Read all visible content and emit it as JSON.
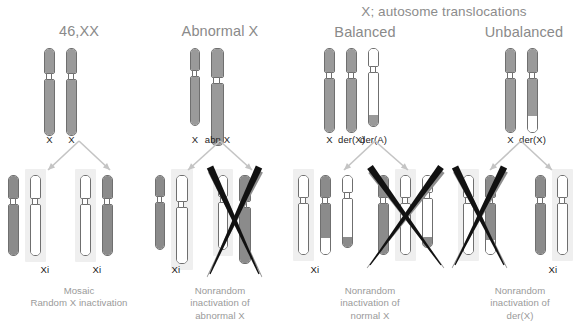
{
  "figure": {
    "title_group": {
      "label": "X; autosome translocations",
      "x": 320,
      "y": 4,
      "width": 248
    },
    "colors": {
      "chromosome_gray": "#9a9a9a",
      "chromosome_dark": "#6b6b6b",
      "chromosome_white": "#ffffff",
      "outline": "#6f6f6f",
      "highlight_box": "#efefef",
      "arrow": "#c4c4c4",
      "cross_mark": "#111111",
      "cross_shadow": "#8d8d8d",
      "title_text": "#8a8a8a",
      "caption_text": "#9a9a9a",
      "label_text": "#1d1d1d"
    },
    "columns": [
      {
        "id": "normal-female",
        "title": "46,XX",
        "title_x": 19,
        "title_y": 23,
        "title_w": 120,
        "parent": {
          "x": 44,
          "y": 48,
          "chromosomes": [
            {
              "name": "X",
              "w": 11,
              "top_h": 26,
              "bot_h": 57,
              "segments": [
                {
                  "from": 0,
                  "to": 1,
                  "fill": "#9a9a9a"
                }
              ]
            },
            {
              "name": "X",
              "w": 11,
              "top_h": 26,
              "bot_h": 57,
              "segments": [
                {
                  "from": 0,
                  "to": 1,
                  "fill": "#9a9a9a"
                }
              ]
            }
          ],
          "labels": [
            "X",
            "X"
          ],
          "label_y": 134
        },
        "arrow": {
          "apex_x": 79,
          "apex_y": 141,
          "left_x": 48,
          "right_x": 110,
          "tip_y": 170
        },
        "cells": [
          {
            "x": 8,
            "y": 175,
            "crossed": false,
            "xi_label": "Xi",
            "xi_label_x": 30,
            "chromosomes": [
              {
                "name": "X",
                "w": 11,
                "top_h": 24,
                "bot_h": 52,
                "highlight": false,
                "segments": [
                  {
                    "from": 0,
                    "to": 1,
                    "fill": "#8b8b8b"
                  }
                ]
              },
              {
                "name": "Xi",
                "w": 11,
                "top_h": 24,
                "bot_h": 52,
                "highlight": true,
                "segments": [
                  {
                    "from": 0,
                    "to": 1,
                    "fill": "#ffffff"
                  }
                ]
              }
            ]
          },
          {
            "x": 80,
            "y": 175,
            "crossed": false,
            "xi_label": "Xi",
            "xi_label_x": 82,
            "chromosomes": [
              {
                "name": "Xi",
                "w": 11,
                "top_h": 24,
                "bot_h": 52,
                "highlight": true,
                "segments": [
                  {
                    "from": 0,
                    "to": 1,
                    "fill": "#ffffff"
                  }
                ]
              },
              {
                "name": "X",
                "w": 11,
                "top_h": 24,
                "bot_h": 52,
                "highlight": false,
                "segments": [
                  {
                    "from": 0,
                    "to": 1,
                    "fill": "#8b8b8b"
                  }
                ]
              }
            ]
          }
        ],
        "caption": "Mosaic\nRandom X inactivation",
        "caption_x": 0,
        "caption_y": 285,
        "caption_w": 158
      },
      {
        "id": "abnormal-x",
        "title": "Abnormal X",
        "title_x": 155,
        "title_y": 23,
        "title_w": 130,
        "parent": {
          "x": 190,
          "y": 48,
          "chromosomes": [
            {
              "name": "X",
              "w": 10,
              "top_h": 23,
              "bot_h": 50,
              "segments": [
                {
                  "from": 0,
                  "to": 1,
                  "fill": "#9a9a9a"
                }
              ]
            },
            {
              "name": "abn X",
              "w": 13,
              "top_h": 30,
              "bot_h": 63,
              "segments": [
                {
                  "from": 0,
                  "to": 1,
                  "fill": "#9a9a9a"
                }
              ]
            }
          ],
          "labels": [
            "X",
            "abn X"
          ],
          "label_y": 134
        },
        "arrow": {
          "apex_x": 220,
          "apex_y": 141,
          "left_x": 188,
          "right_x": 252,
          "tip_y": 170
        },
        "cells": [
          {
            "x": 155,
            "y": 175,
            "crossed": false,
            "xi_label": "Xi",
            "xi_label_x": 161,
            "chromosomes": [
              {
                "name": "X",
                "w": 10,
                "top_h": 22,
                "bot_h": 48,
                "highlight": false,
                "segments": [
                  {
                    "from": 0,
                    "to": 1,
                    "fill": "#8b8b8b"
                  }
                ]
              },
              {
                "name": "abn Xi",
                "w": 12,
                "top_h": 27,
                "bot_h": 57,
                "highlight": true,
                "segments": [
                  {
                    "from": 0,
                    "to": 1,
                    "fill": "#ffffff"
                  }
                ]
              }
            ]
          },
          {
            "x": 218,
            "y": 175,
            "crossed": true,
            "xi_label": "",
            "xi_label_x": 0,
            "chromosomes": [
              {
                "name": "Xi",
                "w": 10,
                "top_h": 22,
                "bot_h": 48,
                "highlight": true,
                "segments": [
                  {
                    "from": 0,
                    "to": 1,
                    "fill": "#ffffff"
                  }
                ]
              },
              {
                "name": "abn X",
                "w": 12,
                "top_h": 27,
                "bot_h": 57,
                "highlight": false,
                "segments": [
                  {
                    "from": 0,
                    "to": 1,
                    "fill": "#8b8b8b"
                  }
                ]
              }
            ]
          }
        ],
        "caption": "Nonrandom\ninactivation of\nabnormal X",
        "caption_x": 150,
        "caption_y": 285,
        "caption_w": 140
      },
      {
        "id": "balanced-translocation",
        "title": "Balanced",
        "title_x": 305,
        "title_y": 24,
        "title_w": 120,
        "parent": {
          "x": 324,
          "y": 48,
          "chromosomes": [
            {
              "name": "X",
              "w": 11,
              "top_h": 25,
              "bot_h": 55,
              "segments": [
                {
                  "from": 0,
                  "to": 1,
                  "fill": "#9a9a9a"
                }
              ]
            },
            {
              "name": "der(X)",
              "w": 11,
              "top_h": 25,
              "bot_h": 55,
              "segments": [
                {
                  "from": 0,
                  "to": 1,
                  "fill": "#9a9a9a"
                }
              ]
            },
            {
              "name": "der(A)",
              "w": 11,
              "top_h": 19,
              "bot_h": 55,
              "segments": [
                {
                  "from": 0,
                  "to": 0.83,
                  "fill": "#ffffff"
                },
                {
                  "from": 0.83,
                  "to": 1,
                  "fill": "#9a9a9a"
                }
              ]
            }
          ],
          "labels": [
            "X",
            "der(X)",
            "der(A)"
          ],
          "label_y": 134
        },
        "arrow": {
          "apex_x": 375,
          "apex_y": 141,
          "left_x": 344,
          "right_x": 408,
          "tip_y": 170
        },
        "cells": [
          {
            "x": 298,
            "y": 175,
            "crossed": false,
            "xi_label": "Xi",
            "xi_label_x": 300,
            "chromosomes": [
              {
                "name": "Xi",
                "w": 11,
                "top_h": 23,
                "bot_h": 52,
                "highlight": true,
                "segments": [
                  {
                    "from": 0,
                    "to": 1,
                    "fill": "#ffffff"
                  }
                ]
              },
              {
                "name": "der(X)",
                "w": 11,
                "top_h": 23,
                "bot_h": 52,
                "highlight": false,
                "segments": [
                  {
                    "from": 0,
                    "to": 0.76,
                    "fill": "#8b8b8b"
                  },
                  {
                    "from": 0.76,
                    "to": 1,
                    "fill": "#ffffff"
                  }
                ]
              },
              {
                "name": "der(A)",
                "w": 11,
                "top_h": 18,
                "bot_h": 50,
                "highlight": false,
                "segments": [
                  {
                    "from": 0,
                    "to": 0.83,
                    "fill": "#ffffff"
                  },
                  {
                    "from": 0.83,
                    "to": 1,
                    "fill": "#8b8b8b"
                  }
                ]
              }
            ]
          },
          {
            "x": 378,
            "y": 175,
            "crossed": true,
            "xi_label": "",
            "xi_label_x": 0,
            "chromosomes": [
              {
                "name": "X",
                "w": 11,
                "top_h": 23,
                "bot_h": 52,
                "highlight": false,
                "segments": [
                  {
                    "from": 0,
                    "to": 1,
                    "fill": "#8b8b8b"
                  }
                ]
              },
              {
                "name": "der(Xi)",
                "w": 11,
                "top_h": 23,
                "bot_h": 52,
                "highlight": true,
                "segments": [
                  {
                    "from": 0,
                    "to": 1,
                    "fill": "#ffffff"
                  }
                ]
              },
              {
                "name": "der(A)",
                "w": 11,
                "top_h": 18,
                "bot_h": 50,
                "highlight": false,
                "segments": [
                  {
                    "from": 0,
                    "to": 0.83,
                    "fill": "#ffffff"
                  },
                  {
                    "from": 0.83,
                    "to": 1,
                    "fill": "#8b8b8b"
                  }
                ]
              }
            ]
          }
        ],
        "caption": "Nonrandom\ninactivation of\nnormal X",
        "caption_x": 300,
        "caption_y": 285,
        "caption_w": 140
      },
      {
        "id": "unbalanced-translocation",
        "title": "Unbalanced",
        "title_x": 460,
        "title_y": 24,
        "title_w": 128,
        "parent": {
          "x": 505,
          "y": 48,
          "chromosomes": [
            {
              "name": "X",
              "w": 11,
              "top_h": 25,
              "bot_h": 55,
              "segments": [
                {
                  "from": 0,
                  "to": 1,
                  "fill": "#9a9a9a"
                }
              ]
            },
            {
              "name": "der(X)",
              "w": 11,
              "top_h": 25,
              "bot_h": 55,
              "segments": [
                {
                  "from": 0,
                  "to": 0.78,
                  "fill": "#9a9a9a"
                },
                {
                  "from": 0.78,
                  "to": 1,
                  "fill": "#ffffff"
                }
              ]
            }
          ],
          "labels": [
            "X",
            "der(X)"
          ],
          "label_y": 134
        },
        "arrow": {
          "apex_x": 521,
          "apex_y": 141,
          "left_x": 490,
          "right_x": 552,
          "tip_y": 170
        },
        "cells": [
          {
            "x": 463,
            "y": 175,
            "crossed": true,
            "xi_label": "",
            "xi_label_x": 0,
            "chromosomes": [
              {
                "name": "Xi",
                "w": 11,
                "top_h": 23,
                "bot_h": 52,
                "highlight": true,
                "segments": [
                  {
                    "from": 0,
                    "to": 1,
                    "fill": "#ffffff"
                  }
                ]
              },
              {
                "name": "der(X)",
                "w": 11,
                "top_h": 23,
                "bot_h": 52,
                "highlight": false,
                "segments": [
                  {
                    "from": 0,
                    "to": 0.78,
                    "fill": "#8b8b8b"
                  },
                  {
                    "from": 0.78,
                    "to": 1,
                    "fill": "#ffffff"
                  }
                ]
              }
            ]
          },
          {
            "x": 535,
            "y": 175,
            "crossed": false,
            "xi_label": "Xi",
            "xi_label_x": 538,
            "chromosomes": [
              {
                "name": "X",
                "w": 11,
                "top_h": 23,
                "bot_h": 52,
                "highlight": false,
                "segments": [
                  {
                    "from": 0,
                    "to": 1,
                    "fill": "#8b8b8b"
                  }
                ]
              },
              {
                "name": "der(Xi)",
                "w": 11,
                "top_h": 23,
                "bot_h": 52,
                "highlight": true,
                "segments": [
                  {
                    "from": 0,
                    "to": 1,
                    "fill": "#ffffff"
                  }
                ]
              }
            ]
          }
        ],
        "caption": "Nonrandom\ninactivation of\nder(X)",
        "caption_x": 450,
        "caption_y": 285,
        "caption_w": 140
      }
    ]
  }
}
